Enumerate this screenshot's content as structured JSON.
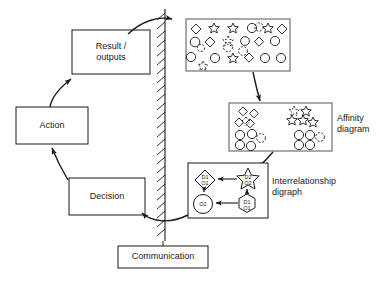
{
  "diagram": {
    "boxes": {
      "result": "Result /\noutputs",
      "action": "Action",
      "decision": "Decision",
      "communication": "Communication"
    },
    "labels": {
      "affinity": "Affinity\ndiagram",
      "interrelationship": "Interrelationship\ndigraph"
    },
    "nodes": {
      "n1": "D1\nO1",
      "n2": "O2",
      "n3": "D2\nO2",
      "n4": "D1\nO1"
    },
    "colors": {
      "stroke": "#1a1a1a",
      "fill": "#ffffff",
      "text": "#1a1a1a"
    },
    "stages": {
      "scatter": "scattered-shapes-box",
      "affinity": "affinity-diagram-box",
      "digraph": "interrelationship-digraph-box"
    },
    "divider": "hatched-wall-divider"
  }
}
